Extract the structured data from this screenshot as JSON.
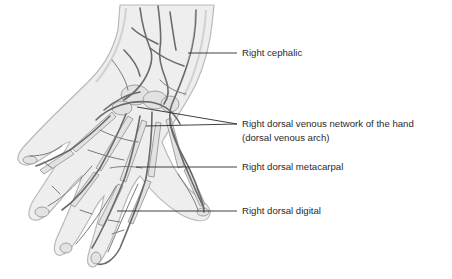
{
  "figure": {
    "style": "grayscale anatomical illustration"
  },
  "labels": [
    {
      "id": "cephalic",
      "text": "Right cephalic"
    },
    {
      "id": "dorsal-venous-network",
      "line1": "Right dorsal venous network of the hand",
      "line2": "(dorsal venous arch)"
    },
    {
      "id": "dorsal-metacarpal",
      "text": "Right dorsal metacarpal"
    },
    {
      "id": "dorsal-digital",
      "text": "Right dorsal digital"
    }
  ],
  "colors": {
    "background": "#ffffff",
    "text": "#2a2a2a",
    "leader_line": "#2a2a2a",
    "vein": "#6a6a6a",
    "skin": "#eeeeee"
  }
}
